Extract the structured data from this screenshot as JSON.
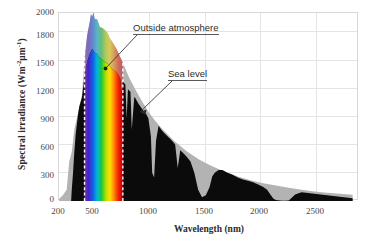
{
  "chart_data": {
    "type": "area",
    "title": "",
    "xlabel": "Wavelength (nm)",
    "ylabel_text": "Spectral irradiance (Wm",
    "ylabel_sup1": "-2",
    "ylabel_mid": "μm",
    "ylabel_sup2": "-1",
    "ylabel_close": ")",
    "ylabel_plain": "Spectral irradiance (Wm⁻²μm⁻¹)",
    "xlim": [
      200,
      2550
    ],
    "ylim": [
      0,
      2000
    ],
    "xticks": [
      200,
      500,
      1000,
      1500,
      2000,
      2500
    ],
    "yticks": [
      0,
      300,
      600,
      900,
      1200,
      1500,
      1800,
      2000
    ],
    "grid": true,
    "legend_position": "none",
    "annotations": [
      {
        "label": "Outside atmosphere",
        "target_x": 1010,
        "target_y": 1480
      },
      {
        "label": "Sea level",
        "target_x": 1290,
        "target_y": 1030
      }
    ],
    "visible_band": {
      "start_nm": 400,
      "end_nm": 700,
      "marker": "white-dashed-lines"
    },
    "series": [
      {
        "name": "Outside atmosphere",
        "color": "#b3b3b3",
        "x": [
          200,
          230,
          260,
          280,
          300,
          320,
          340,
          360,
          380,
          400,
          420,
          440,
          450,
          460,
          470,
          480,
          500,
          520,
          540,
          560,
          580,
          600,
          620,
          650,
          680,
          700,
          750,
          800,
          850,
          900,
          950,
          1000,
          1100,
          1200,
          1300,
          1400,
          1500,
          1600,
          1700,
          1800,
          1900,
          2000,
          2100,
          2200,
          2300,
          2400,
          2500
        ],
        "y": [
          20,
          60,
          120,
          420,
          520,
          760,
          880,
          1010,
          1130,
          1520,
          1760,
          1900,
          1990,
          1960,
          2010,
          1940,
          1930,
          1850,
          1840,
          1820,
          1790,
          1730,
          1690,
          1620,
          1530,
          1470,
          1310,
          1180,
          1060,
          950,
          860,
          780,
          640,
          530,
          440,
          370,
          310,
          260,
          220,
          190,
          165,
          140,
          120,
          102,
          88,
          76,
          66
        ]
      },
      {
        "name": "Sea level",
        "color": "#0b0b0b",
        "x": [
          295,
          300,
          310,
          320,
          330,
          340,
          350,
          360,
          380,
          400,
          420,
          440,
          460,
          480,
          500,
          520,
          540,
          560,
          580,
          600,
          620,
          640,
          660,
          680,
          690,
          700,
          720,
          730,
          740,
          760,
          770,
          790,
          800,
          820,
          840,
          860,
          880,
          900,
          920,
          930,
          945,
          960,
          980,
          1000,
          1020,
          1050,
          1080,
          1110,
          1130,
          1150,
          1180,
          1200,
          1230,
          1260,
          1290,
          1320,
          1350,
          1380,
          1400,
          1420,
          1450,
          1480,
          1520,
          1560,
          1600,
          1640,
          1680,
          1720,
          1760,
          1800,
          1830,
          1860,
          1880,
          1900,
          1930,
          1960,
          2000,
          2050,
          2100,
          2150,
          2200,
          2250,
          2300,
          2350,
          2400,
          2450,
          2500
        ],
        "y": [
          0,
          120,
          300,
          520,
          700,
          820,
          930,
          1010,
          1100,
          1330,
          1480,
          1560,
          1620,
          1580,
          1560,
          1520,
          1500,
          1480,
          1460,
          1430,
          1400,
          1380,
          1350,
          1300,
          1150,
          1270,
          1240,
          880,
          1190,
          1160,
          760,
          1110,
          1090,
          1040,
          1000,
          960,
          930,
          880,
          690,
          300,
          250,
          640,
          800,
          760,
          730,
          690,
          650,
          600,
          350,
          540,
          500,
          470,
          420,
          300,
          120,
          40,
          60,
          150,
          260,
          300,
          330,
          330,
          300,
          280,
          250,
          230,
          215,
          200,
          175,
          150,
          120,
          60,
          25,
          10,
          4,
          2,
          6,
          70,
          92,
          86,
          78,
          70,
          62,
          54,
          46,
          38,
          30
        ]
      }
    ]
  },
  "axis": {
    "xtick_labels": [
      "200",
      "500",
      "1000",
      "1500",
      "2000",
      "2500"
    ],
    "ytick_labels": [
      "0",
      "300",
      "600",
      "900",
      "1200",
      "1500",
      "1800",
      "2000"
    ]
  },
  "annotations": {
    "outside": "Outside atmosphere",
    "sea_level": "Sea level"
  },
  "colors": {
    "outside_atmosphere": "#b3b3b3",
    "sea_level": "#0b0b0b",
    "grid": "#e3e3e8",
    "frame": "#d8d8dc",
    "text": "#3a3a3a",
    "dashed_marker": "#ffffff"
  }
}
